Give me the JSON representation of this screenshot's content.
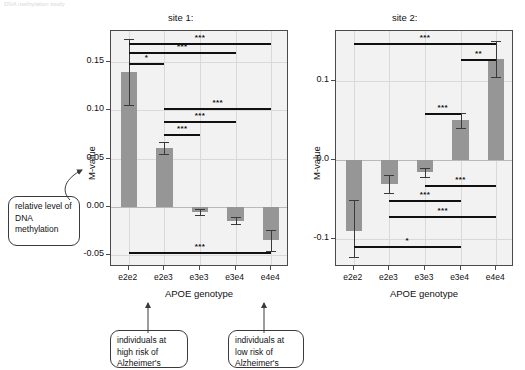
{
  "header": {
    "cut_text": "DNA methylation study"
  },
  "annotations": {
    "y_callout": "relative level of DNA methylation",
    "left_callout": "individuals at high risk of Alzheimer's",
    "right_callout": "individuals at low risk of Alzheimer's"
  },
  "chart_data": [
    {
      "type": "bar",
      "title": "site 1:",
      "xlabel": "APOE genotype",
      "ylabel": "M-value",
      "categories": [
        "e2e2",
        "e2e3",
        "e3e3",
        "e3e4",
        "e4e4"
      ],
      "values": [
        0.14,
        0.061,
        -0.005,
        -0.014,
        -0.034
      ],
      "errors_low": [
        0.106,
        0.055,
        -0.008,
        -0.018,
        -0.045
      ],
      "errors_high": [
        0.174,
        0.067,
        -0.002,
        -0.01,
        -0.024
      ],
      "ylim": [
        -0.062,
        0.182
      ],
      "yticks": [
        0.15,
        0.1,
        0.05,
        0.0,
        -0.05
      ],
      "ytick_labels": [
        "0.15",
        "0.10",
        "0.05",
        "0.00",
        "-0.05"
      ],
      "grid": true,
      "bar_color": "#969696",
      "panel_color": "#f2f2f2",
      "significance": [
        {
          "from": "e2e2",
          "to": "e4e4",
          "label": "***",
          "y": 0.17
        },
        {
          "from": "e2e2",
          "to": "e3e4",
          "label": "***",
          "y": 0.16
        },
        {
          "from": "e2e2",
          "to": "e2e3",
          "label": "*",
          "y": 0.149
        },
        {
          "from": "e2e3",
          "to": "e4e4",
          "label": "***",
          "y": 0.102
        },
        {
          "from": "e2e3",
          "to": "e3e4",
          "label": "***",
          "y": 0.089
        },
        {
          "from": "e2e3",
          "to": "e3e3",
          "label": "***",
          "y": 0.076
        },
        {
          "from": "e2e2",
          "to": "e4e4",
          "label": "***",
          "y": -0.047
        }
      ]
    },
    {
      "type": "bar",
      "title": "site 2:",
      "xlabel": "APOE genotype",
      "ylabel": "M-value",
      "categories": [
        "e2e2",
        "e2e3",
        "e3e3",
        "e3e4",
        "e4e4"
      ],
      "values": [
        -0.09,
        -0.03,
        -0.015,
        0.05,
        0.128
      ],
      "errors_low": [
        -0.122,
        -0.042,
        -0.021,
        0.041,
        0.105
      ],
      "errors_high": [
        -0.05,
        -0.019,
        -0.01,
        0.059,
        0.151
      ],
      "ylim": [
        -0.135,
        0.163
      ],
      "yticks": [
        0.1,
        0.0,
        -0.1
      ],
      "ytick_labels": [
        "0.1",
        "0.0",
        "-0.1"
      ],
      "grid": true,
      "bar_color": "#969696",
      "panel_color": "#f2f2f2",
      "significance": [
        {
          "from": "e2e2",
          "to": "e4e4",
          "label": "***",
          "y": 0.148
        },
        {
          "from": "e3e4",
          "to": "e4e4",
          "label": "**",
          "y": 0.128
        },
        {
          "from": "e3e3",
          "to": "e3e4",
          "label": "***",
          "y": 0.06
        },
        {
          "from": "e3e3",
          "to": "e4e4",
          "label": "***",
          "y": -0.031
        },
        {
          "from": "e2e3",
          "to": "e3e4",
          "label": "***",
          "y": -0.051
        },
        {
          "from": "e2e3",
          "to": "e4e4",
          "label": "***",
          "y": -0.07
        },
        {
          "from": "e2e2",
          "to": "e3e4",
          "label": "*",
          "y": -0.108
        }
      ]
    }
  ]
}
